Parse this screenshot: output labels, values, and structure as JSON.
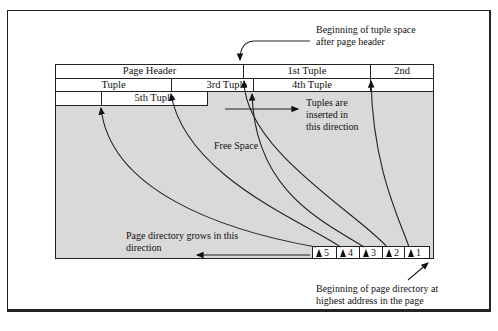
{
  "diagram": {
    "page": {
      "row1": [
        {
          "label": "Page Header"
        },
        {
          "label": "1st Tuple"
        },
        {
          "label": "2nd"
        }
      ],
      "row2": [
        {
          "label": "Tuple"
        },
        {
          "label": "3rd Tuple"
        },
        {
          "label": "4th Tuple"
        }
      ],
      "row3": [
        {
          "label": "5th Tuple"
        }
      ],
      "free_space": "Free Space"
    },
    "directory": [
      "5",
      "4",
      "3",
      "2",
      "1"
    ],
    "annotations": {
      "tuple_space_line1": "Beginning of tuple space",
      "tuple_space_line2": "after page header",
      "insert_line1": "Tuples are",
      "insert_line2": "inserted in",
      "insert_line3": "this direction",
      "dir_grow_line1": "Page directory grows in this",
      "dir_grow_line2": "direction",
      "dir_begin_line1": "Beginning of page directory at",
      "dir_begin_line2": "highest address in the page"
    }
  }
}
